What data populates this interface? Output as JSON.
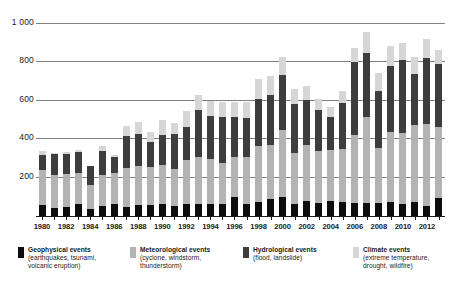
{
  "chart_data": {
    "type": "bar",
    "stacked": true,
    "title": "",
    "subtitle": "",
    "xlabel": "",
    "ylabel": "",
    "ylim": [
      0,
      1000
    ],
    "yticks": [
      200,
      400,
      600,
      800,
      1000
    ],
    "ytick_labels": [
      "200",
      "400",
      "600",
      "800",
      "1 000"
    ],
    "grid": true,
    "legend_position": "bottom",
    "categories": [
      "1980",
      "1981",
      "1982",
      "1983",
      "1984",
      "1985",
      "1986",
      "1987",
      "1988",
      "1989",
      "1990",
      "1991",
      "1992",
      "1993",
      "1994",
      "1995",
      "1996",
      "1997",
      "1998",
      "1999",
      "2000",
      "2001",
      "2002",
      "2003",
      "2004",
      "2005",
      "2006",
      "2007",
      "2008",
      "2009",
      "2010",
      "2011",
      "2012",
      "2013"
    ],
    "xtick_labels": [
      "1980",
      "1982",
      "1984",
      "1986",
      "1988",
      "1990",
      "1992",
      "1994",
      "1996",
      "1998",
      "2000",
      "2002",
      "2004",
      "2006",
      "2008",
      "2010",
      "2012"
    ],
    "series": [
      {
        "name": "Geophysical events",
        "sub": "(earthquakes, tsunami, volcanic eruption)",
        "color": "#0d0d0d",
        "values": [
          58,
          40,
          47,
          63,
          37,
          53,
          60,
          48,
          58,
          59,
          65,
          50,
          62,
          62,
          63,
          60,
          97,
          62,
          72,
          88,
          100,
          62,
          78,
          70,
          78,
          72,
          68,
          70,
          66,
          75,
          62,
          72,
          52,
          92
        ]
      },
      {
        "name": "Meteorological events",
        "sub": "(cyclone, windstorm, thunderstorm)",
        "color": "#b3b3b3",
        "values": [
          182,
          172,
          173,
          158,
          126,
          161,
          163,
          203,
          203,
          196,
          202,
          195,
          228,
          246,
          232,
          215,
          208,
          243,
          294,
          283,
          348,
          266,
          292,
          267,
          263,
          276,
          355,
          443,
          287,
          361,
          368,
          400,
          425,
          372
        ]
      },
      {
        "name": "Hydrological events",
        "sub": "(flood, landslide)",
        "color": "#3d3d3d",
        "values": [
          77,
          108,
          104,
          113,
          98,
          125,
          83,
          166,
          166,
          128,
          153,
          180,
          170,
          245,
          222,
          238,
          210,
          205,
          242,
          258,
          282,
          253,
          233,
          213,
          172,
          237,
          379,
          333,
          298,
          344,
          383,
          268,
          343,
          325
        ]
      },
      {
        "name": "Climate events",
        "sub": "(extreme temperature, drought, wildfire)",
        "color": "#d6d6d6",
        "values": [
          20,
          8,
          7,
          7,
          0,
          25,
          10,
          52,
          63,
          56,
          78,
          58,
          85,
          78,
          82,
          78,
          75,
          82,
          105,
          98,
          98,
          78,
          72,
          60,
          53,
          65,
          72,
          110,
          92,
          105,
          88,
          85,
          100,
          72
        ]
      }
    ]
  },
  "legend": [
    {
      "label": "Geophysical events",
      "sub": "(earthquakes, tsunami,\nvolcanic eruption)",
      "color": "#0d0d0d"
    },
    {
      "label": "Meteorological events",
      "sub": "(cyclone, windstorm,\nthunderstorm)",
      "color": "#b3b3b3"
    },
    {
      "label": "Hydrological events",
      "sub": "(flood, landslide)",
      "color": "#3d3d3d"
    },
    {
      "label": "Climate events",
      "sub": "(extreme temperature,\ndrought, wildfire)",
      "color": "#d6d6d6"
    }
  ],
  "colors": {
    "gridline": "#808080",
    "axis": "#1a1a1a",
    "background": "#ffffff"
  }
}
